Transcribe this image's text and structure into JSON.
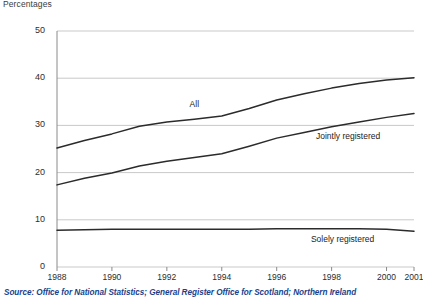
{
  "units_label": "Percentages",
  "source_note": "Source: Office for National Statistics; General Register Office for Scotland; Northern Ireland",
  "colors": {
    "line": "#2b2b2b",
    "grid": "#c9c9c9",
    "axis": "#8a8a8a",
    "text": "#2d2d2d",
    "source_text": "#1b3f8b"
  },
  "chart_data": {
    "type": "line",
    "title": "",
    "subtitle": "",
    "xlabel": "",
    "ylabel": "Percentages",
    "grid": true,
    "legend_position": "inline-labels",
    "xlim": [
      1988,
      2001
    ],
    "ylim": [
      0,
      50
    ],
    "ytick_labels": [
      "0",
      "10",
      "20",
      "30",
      "40",
      "50"
    ],
    "ytick_values": [
      0,
      10,
      20,
      30,
      40,
      50
    ],
    "xtick_labels": [
      "1988",
      "1990",
      "1992",
      "1994",
      "1996",
      "1998",
      "2000",
      "2001"
    ],
    "xtick_values": [
      1988,
      1990,
      1992,
      1994,
      1996,
      1998,
      2000,
      2001
    ],
    "x": [
      1988,
      1989,
      1990,
      1991,
      1992,
      1993,
      1994,
      1995,
      1996,
      1997,
      1998,
      1999,
      2000,
      2001
    ],
    "series": [
      {
        "name": "All",
        "label": "All",
        "values": [
          25.2,
          26.8,
          28.2,
          29.8,
          30.7,
          31.3,
          32.0,
          33.6,
          35.4,
          36.7,
          37.9,
          38.9,
          39.6,
          40.1
        ]
      },
      {
        "name": "Jointly registered",
        "label": "Jointly registered",
        "values": [
          17.4,
          18.8,
          19.9,
          21.4,
          22.4,
          23.2,
          24.0,
          25.6,
          27.3,
          28.5,
          29.7,
          30.7,
          31.7,
          32.5
        ]
      },
      {
        "name": "Solely registered",
        "label": "Solely registered",
        "values": [
          7.8,
          7.9,
          8.0,
          8.0,
          8.0,
          8.0,
          8.0,
          8.0,
          8.1,
          8.1,
          8.1,
          8.1,
          8.0,
          7.6
        ]
      }
    ]
  }
}
